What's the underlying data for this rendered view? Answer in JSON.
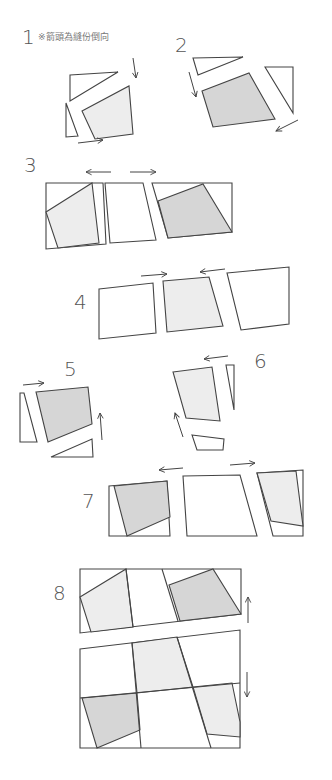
{
  "note": "※箭頭為縫份倒向",
  "colors": {
    "line": "#444444",
    "white": "#ffffff",
    "light": "#ededed",
    "dark": "#d6d6d6"
  },
  "steps": [
    {
      "label": "1",
      "pieces": [
        {
          "fill": "white",
          "pts": [
            [
              70,
              75
            ],
            [
              118,
              72
            ],
            [
              70,
              101
            ]
          ]
        },
        {
          "fill": "light",
          "pts": [
            [
              82,
              111
            ],
            [
              129,
              86
            ],
            [
              133,
              134
            ],
            [
              95,
              139
            ]
          ]
        },
        {
          "fill": "white",
          "pts": [
            [
              66,
              103
            ],
            [
              78,
              136
            ],
            [
              66,
              137
            ]
          ]
        }
      ],
      "arrows": [
        {
          "from": [
            133,
            58
          ],
          "to": [
            136,
            78
          ]
        },
        {
          "from": [
            78,
            143
          ],
          "to": [
            103,
            140
          ]
        }
      ]
    },
    {
      "label": "2",
      "pieces": [
        {
          "fill": "white",
          "pts": [
            [
              193,
              58
            ],
            [
              243,
              57
            ],
            [
              198,
              75
            ]
          ]
        },
        {
          "fill": "dark",
          "pts": [
            [
              202,
              91
            ],
            [
              249,
              73
            ],
            [
              275,
              119
            ],
            [
              213,
              127
            ]
          ]
        },
        {
          "fill": "white",
          "pts": [
            [
              265,
              67
            ],
            [
              293,
              67
            ],
            [
              293,
              113
            ]
          ]
        }
      ],
      "arrows": [
        {
          "from": [
            189,
            72
          ],
          "to": [
            196,
            97
          ]
        },
        {
          "from": [
            298,
            120
          ],
          "to": [
            276,
            131
          ]
        }
      ]
    },
    {
      "label": "3",
      "pieces": [
        {
          "fill": "white",
          "pts": [
            [
              46,
              183
            ],
            [
              103,
              183
            ],
            [
              106,
              244
            ],
            [
              46,
              249
            ]
          ]
        },
        {
          "fill": "light",
          "pts": [
            [
              46,
              212
            ],
            [
              92,
              183
            ],
            [
              99,
              243
            ],
            [
              58,
              248
            ]
          ]
        },
        {
          "fill": "white",
          "pts": [
            [
              105,
              183
            ],
            [
              143,
              183
            ],
            [
              156,
              240
            ],
            [
              110,
              243
            ]
          ]
        },
        {
          "fill": "white",
          "pts": [
            [
              152,
              183
            ],
            [
              232,
              183
            ],
            [
              232,
              232
            ],
            [
              168,
              238
            ]
          ]
        },
        {
          "fill": "dark",
          "pts": [
            [
              158,
              201
            ],
            [
              203,
              184
            ],
            [
              232,
              232
            ],
            [
              168,
              238
            ]
          ]
        }
      ],
      "arrows": [
        {
          "from": [
            111,
            172
          ],
          "to": [
            86,
            172
          ]
        },
        {
          "from": [
            130,
            172
          ],
          "to": [
            156,
            172
          ]
        }
      ]
    },
    {
      "label": "4",
      "pieces": [
        {
          "fill": "white",
          "pts": [
            [
              99,
              289
            ],
            [
              153,
              283
            ],
            [
              156,
              333
            ],
            [
              99,
              339
            ]
          ]
        },
        {
          "fill": "light",
          "pts": [
            [
              163,
              281
            ],
            [
              209,
              277
            ],
            [
              223,
              326
            ],
            [
              167,
              332
            ]
          ]
        },
        {
          "fill": "white",
          "pts": [
            [
              227,
              273
            ],
            [
              289,
              267
            ],
            [
              289,
              324
            ],
            [
              241,
              330
            ]
          ]
        }
      ],
      "arrows": [
        {
          "from": [
            141,
            276
          ],
          "to": [
            167,
            274
          ]
        },
        {
          "from": [
            225,
            269
          ],
          "to": [
            200,
            272
          ]
        }
      ]
    },
    {
      "label": "5",
      "pieces": [
        {
          "fill": "white",
          "pts": [
            [
              20,
              393
            ],
            [
              24,
              393
            ],
            [
              37,
              442
            ],
            [
              20,
              442
            ]
          ]
        },
        {
          "fill": "dark",
          "pts": [
            [
              36,
              392
            ],
            [
              88,
              387
            ],
            [
              92,
              424
            ],
            [
              48,
              442
            ]
          ]
        },
        {
          "fill": "white",
          "pts": [
            [
              51,
              457
            ],
            [
              92,
              439
            ],
            [
              93,
              457
            ]
          ]
        }
      ],
      "arrows": [
        {
          "from": [
            23,
            385
          ],
          "to": [
            44,
            383
          ]
        },
        {
          "from": [
            102,
            440
          ],
          "to": [
            100,
            413
          ]
        }
      ]
    },
    {
      "label": "6",
      "pieces": [
        {
          "fill": "light",
          "pts": [
            [
              173,
              372
            ],
            [
              212,
              367
            ],
            [
              220,
              421
            ],
            [
              186,
              418
            ]
          ]
        },
        {
          "fill": "white",
          "pts": [
            [
              226,
              365
            ],
            [
              234,
              365
            ],
            [
              234,
              410
            ]
          ]
        },
        {
          "fill": "white",
          "pts": [
            [
              192,
              435
            ],
            [
              224,
              439
            ],
            [
              223,
              450
            ],
            [
              197,
              450
            ]
          ]
        }
      ],
      "arrows": [
        {
          "from": [
            228,
            356
          ],
          "to": [
            204,
            359
          ]
        },
        {
          "from": [
            183,
            437
          ],
          "to": [
            175,
            413
          ]
        }
      ]
    },
    {
      "label": "7",
      "pieces": [
        {
          "fill": "white",
          "pts": [
            [
              109,
              486
            ],
            [
              167,
              481
            ],
            [
              170,
              536
            ],
            [
              109,
              536
            ]
          ]
        },
        {
          "fill": "dark",
          "pts": [
            [
              114,
              486
            ],
            [
              167,
              481
            ],
            [
              170,
              517
            ],
            [
              127,
              536
            ]
          ]
        },
        {
          "fill": "white",
          "pts": [
            [
              183,
              476
            ],
            [
              240,
              475
            ],
            [
              257,
              536
            ],
            [
              187,
              536
            ]
          ]
        },
        {
          "fill": "white",
          "pts": [
            [
              257,
              473
            ],
            [
              303,
              470
            ],
            [
              303,
              536
            ],
            [
              273,
              536
            ]
          ]
        },
        {
          "fill": "light",
          "pts": [
            [
              257,
              473
            ],
            [
              296,
              471
            ],
            [
              303,
              526
            ],
            [
              271,
              521
            ]
          ]
        }
      ],
      "arrows": [
        {
          "from": [
            183,
            468
          ],
          "to": [
            159,
            470
          ]
        },
        {
          "from": [
            230,
            465
          ],
          "to": [
            255,
            463
          ]
        }
      ]
    },
    {
      "label": "8",
      "pieces": [
        {
          "fill": "white",
          "pts": [
            [
              80,
              569
            ],
            [
              241,
              569
            ],
            [
              241,
              614
            ],
            [
              80,
              633
            ]
          ]
        },
        {
          "fill": "light",
          "pts": [
            [
              80,
              597
            ],
            [
              126,
              569
            ],
            [
              133,
              627
            ],
            [
              91,
              632
            ]
          ]
        },
        {
          "fill": "dark",
          "pts": [
            [
              169,
              585
            ],
            [
              213,
              569
            ],
            [
              241,
              614
            ],
            [
              180,
              621
            ]
          ]
        },
        {
          "fill": "white",
          "pts": [
            [
              80,
              649
            ],
            [
              240,
              630
            ],
            [
              240,
              748
            ],
            [
              80,
              748
            ]
          ]
        },
        {
          "fill": "light",
          "pts": [
            [
              132,
              643
            ],
            [
              177,
              637
            ],
            [
              193,
              687
            ],
            [
              137,
              693
            ]
          ]
        },
        {
          "fill": "dark",
          "pts": [
            [
              82,
              698
            ],
            [
              137,
              693
            ],
            [
              140,
              730
            ],
            [
              97,
              748
            ]
          ]
        },
        {
          "fill": "light",
          "pts": [
            [
              193,
              687
            ],
            [
              232,
              683
            ],
            [
              240,
              722
            ],
            [
              240,
              737
            ],
            [
              207,
              734
            ]
          ]
        }
      ],
      "lines": [
        [
          [
            126,
            569
          ],
          [
            133,
            627
          ]
        ],
        [
          [
            162,
            569
          ],
          [
            178,
            621
          ]
        ],
        [
          [
            132,
            643
          ],
          [
            141,
            748
          ]
        ],
        [
          [
            177,
            637
          ],
          [
            211,
            748
          ]
        ],
        [
          [
            80,
            698
          ],
          [
            240,
            683
          ]
        ]
      ],
      "arrows": [
        {
          "from": [
            248,
            623
          ],
          "to": [
            248,
            597
          ]
        },
        {
          "from": [
            247,
            672
          ],
          "to": [
            247,
            697
          ]
        }
      ]
    }
  ]
}
